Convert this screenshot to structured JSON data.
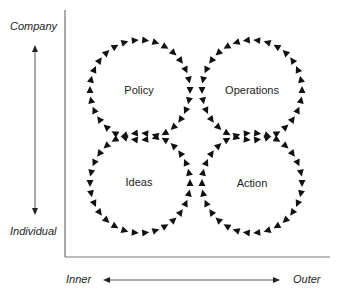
{
  "diagram": {
    "axes": {
      "y_top_label": "Company",
      "y_bottom_label": "Individual",
      "x_left_label": "Inner",
      "x_right_label": "Outer"
    },
    "circles": [
      {
        "label": "Policy",
        "cx": 140,
        "cy": 90,
        "direction": "clockwise"
      },
      {
        "label": "Operations",
        "cx": 252,
        "cy": 90,
        "direction": "counter-clockwise"
      },
      {
        "label": "Ideas",
        "cx": 140,
        "cy": 183,
        "direction": "counter-clockwise"
      },
      {
        "label": "Action",
        "cx": 252,
        "cy": 183,
        "direction": "clockwise"
      }
    ],
    "colors": {
      "line": "#555555",
      "arrow": "#111111"
    }
  }
}
